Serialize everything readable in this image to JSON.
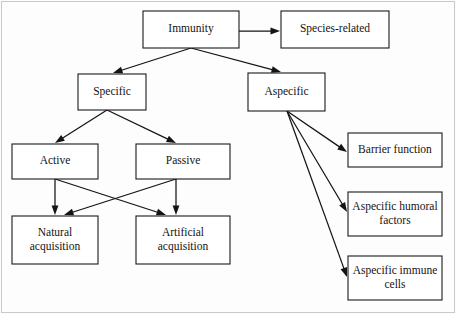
{
  "diagram": {
    "type": "flowchart",
    "colors": {
      "box_fill": "#ffffff",
      "box_stroke": "#1a1a1a",
      "text": "#141414",
      "frame": "#c9c9c9",
      "background": "#fdfdfd"
    },
    "nodes": [
      {
        "id": "immunity",
        "label": "Immunity",
        "lines": [
          "Immunity"
        ],
        "x": 143,
        "y": 11,
        "w": 96,
        "h": 37
      },
      {
        "id": "species_related",
        "label": "Species-related",
        "lines": [
          "Species-related"
        ],
        "x": 281,
        "y": 11,
        "w": 108,
        "h": 37
      },
      {
        "id": "specific",
        "label": "Specific",
        "lines": [
          "Specific"
        ],
        "x": 78,
        "y": 74,
        "w": 68,
        "h": 36
      },
      {
        "id": "aspecific",
        "label": "Aspecific",
        "lines": [
          "Aspecific"
        ],
        "x": 248,
        "y": 73,
        "w": 77,
        "h": 38
      },
      {
        "id": "active",
        "label": "Active",
        "lines": [
          "Active"
        ],
        "x": 12,
        "y": 144,
        "w": 86,
        "h": 35
      },
      {
        "id": "passive",
        "label": "Passive",
        "lines": [
          "Passive"
        ],
        "x": 136,
        "y": 144,
        "w": 94,
        "h": 35
      },
      {
        "id": "natural_acquisition",
        "label": "Natural acquisition",
        "lines": [
          "Natural",
          "acquisition"
        ],
        "x": 12,
        "y": 216,
        "w": 86,
        "h": 48
      },
      {
        "id": "artificial_acquisition",
        "label": "Artificial acquisition",
        "lines": [
          "Artificial",
          "acquisition"
        ],
        "x": 136,
        "y": 216,
        "w": 94,
        "h": 48
      },
      {
        "id": "barrier_function",
        "label": "Barrier function",
        "lines": [
          "Barrier function"
        ],
        "x": 348,
        "y": 133,
        "w": 94,
        "h": 34
      },
      {
        "id": "aspecific_humoral_factors",
        "label": "Aspecific humoral factors",
        "lines": [
          "Aspecific humoral",
          "factors"
        ],
        "x": 348,
        "y": 192,
        "w": 94,
        "h": 44
      },
      {
        "id": "aspecific_immune_cells",
        "label": "Aspecific immune cells",
        "lines": [
          "Aspecific immune",
          "cells"
        ],
        "x": 348,
        "y": 256,
        "w": 94,
        "h": 44
      }
    ],
    "edges": [
      {
        "id": "immunity-species_related",
        "from": "immunity",
        "to": "species_related",
        "x1": 239,
        "y1": 31,
        "x2": 280,
        "y2": 31
      },
      {
        "id": "immunity-specific",
        "from": "immunity",
        "to": "specific",
        "x1": 191,
        "y1": 48,
        "x2": 113,
        "y2": 73
      },
      {
        "id": "immunity-aspecific",
        "from": "immunity",
        "to": "aspecific",
        "x1": 191,
        "y1": 48,
        "x2": 281,
        "y2": 72
      },
      {
        "id": "specific-active",
        "from": "specific",
        "to": "active",
        "x1": 107,
        "y1": 110,
        "x2": 55,
        "y2": 143
      },
      {
        "id": "specific-passive",
        "from": "specific",
        "to": "passive",
        "x1": 107,
        "y1": 110,
        "x2": 176,
        "y2": 143
      },
      {
        "id": "active-natural",
        "from": "active",
        "to": "natural_acquisition",
        "x1": 55,
        "y1": 179,
        "x2": 55,
        "y2": 215
      },
      {
        "id": "active-artificial",
        "from": "active",
        "to": "artificial_acquisition",
        "x1": 55,
        "y1": 179,
        "x2": 166,
        "y2": 215
      },
      {
        "id": "passive-natural",
        "from": "passive",
        "to": "natural_acquisition",
        "x1": 176,
        "y1": 179,
        "x2": 64,
        "y2": 215
      },
      {
        "id": "passive-artificial",
        "from": "passive",
        "to": "artificial_acquisition",
        "x1": 176,
        "y1": 179,
        "x2": 176,
        "y2": 215
      },
      {
        "id": "aspecific-barrier",
        "from": "aspecific",
        "to": "barrier_function",
        "x1": 287,
        "y1": 111,
        "x2": 347,
        "y2": 152
      },
      {
        "id": "aspecific-humoral",
        "from": "aspecific",
        "to": "aspecific_humoral_factors",
        "x1": 287,
        "y1": 111,
        "x2": 347,
        "y2": 212
      },
      {
        "id": "aspecific-immune_cells",
        "from": "aspecific",
        "to": "aspecific_immune_cells",
        "x1": 287,
        "y1": 111,
        "x2": 347,
        "y2": 277
      }
    ]
  }
}
